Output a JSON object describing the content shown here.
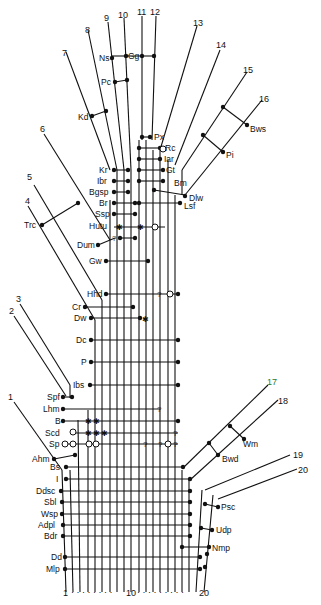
{
  "diagram": {
    "type": "character-state cladogram / taxon ladder",
    "axis": {
      "start_label": "1",
      "mid_label": "10",
      "end_label": "20",
      "dotted": true
    },
    "lineage_numbers": [
      "1",
      "2",
      "3",
      "4",
      "5",
      "6",
      "7",
      "8",
      "9",
      "10",
      "11",
      "12",
      "13",
      "14",
      "15",
      "16",
      "17",
      "18",
      "19",
      "20"
    ],
    "lineage_17_color": "#2a7a2a",
    "taxa_labels": {
      "upper_left": [
        "Ns",
        "Gg",
        "Pc",
        "Kd",
        "Kr",
        "Ibr",
        "Bgsp",
        "Br",
        "Ssp",
        "Hutu",
        "Dum",
        "Gw",
        "Trc"
      ],
      "upper_right": [
        "Px",
        "Rc",
        "Iar",
        "Gt",
        "Bm",
        "Dlw",
        "Lsf",
        "Bws",
        "Pi"
      ],
      "middle_left": [
        "Hhd",
        "Cr",
        "Dw",
        "Dc",
        "P",
        "Ibs"
      ],
      "lower_left": [
        "Spf",
        "Lhm",
        "B",
        "Scd",
        "Sp",
        "Ahm",
        "Bs",
        "I",
        "Ddsc",
        "Sbl",
        "Wsp",
        "Adpl",
        "Bdr",
        "Dd",
        "Mlp"
      ],
      "lower_right": [
        "Wm",
        "Bwd",
        "Psc",
        "Udp",
        "Nmp"
      ]
    },
    "markers": {
      "filled_dot": "character present",
      "open_circle": "character absent / reversed",
      "star": "convergent state",
      "question": "uncertain"
    }
  }
}
